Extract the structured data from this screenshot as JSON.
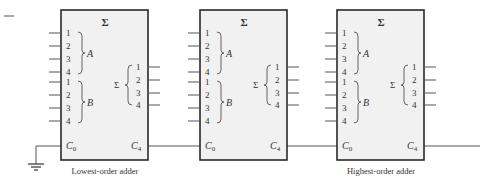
{
  "diagram": {
    "type": "cascaded 4-bit parallel adders",
    "colors": {
      "box_fill": "#f1f1f1",
      "box_stroke": "#2a2a2a",
      "wire": "#555555",
      "text": "#333333"
    },
    "adders": [
      {
        "title": "Σ",
        "input_a_label": "A",
        "input_b_label": "B",
        "output_label": "Σ",
        "a_pins": [
          "1",
          "2",
          "3",
          "4"
        ],
        "b_pins": [
          "1",
          "2",
          "3",
          "4"
        ],
        "sum_pins": [
          "1",
          "2",
          "3",
          "4"
        ],
        "carry_in": "C",
        "carry_in_sub": "0",
        "carry_out": "C",
        "carry_out_sub": "4",
        "caption": "Lowest-order adder"
      },
      {
        "title": "Σ",
        "input_a_label": "A",
        "input_b_label": "B",
        "output_label": "Σ",
        "a_pins": [
          "1",
          "2",
          "3",
          "4"
        ],
        "b_pins": [
          "1",
          "2",
          "3",
          "4"
        ],
        "sum_pins": [
          "1",
          "2",
          "3",
          "4"
        ],
        "carry_in": "C",
        "carry_in_sub": "0",
        "carry_out": "C",
        "carry_out_sub": "4",
        "caption": ""
      },
      {
        "title": "Σ",
        "input_a_label": "A",
        "input_b_label": "B",
        "output_label": "Σ",
        "a_pins": [
          "1",
          "2",
          "3",
          "4"
        ],
        "b_pins": [
          "1",
          "2",
          "3",
          "4"
        ],
        "sum_pins": [
          "1",
          "2",
          "3",
          "4"
        ],
        "carry_in": "C",
        "carry_in_sub": "0",
        "carry_out": "C",
        "carry_out_sub": "4",
        "caption": "Highest-order adder"
      }
    ],
    "ground_symbol": "ground"
  }
}
